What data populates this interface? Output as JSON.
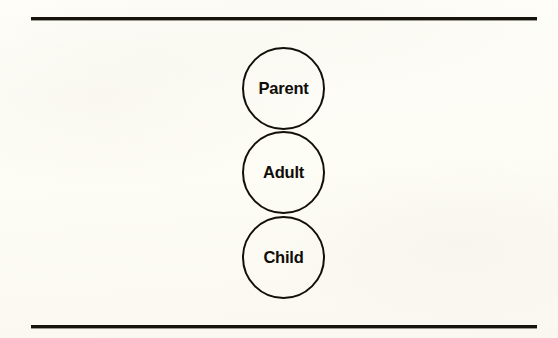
{
  "figure": {
    "kind": "ego-state-diagram",
    "caption": "",
    "background_color": "#fdfcf5",
    "ink_color": "#120f0a",
    "rules": {
      "top_label": "top-horizontal-rule",
      "bottom_label": "bottom-horizontal-rule",
      "color": "#16120c"
    },
    "circles": [
      {
        "id": "parent",
        "label": "Parent"
      },
      {
        "id": "adult",
        "label": "Adult"
      },
      {
        "id": "child",
        "label": "Child"
      }
    ]
  }
}
